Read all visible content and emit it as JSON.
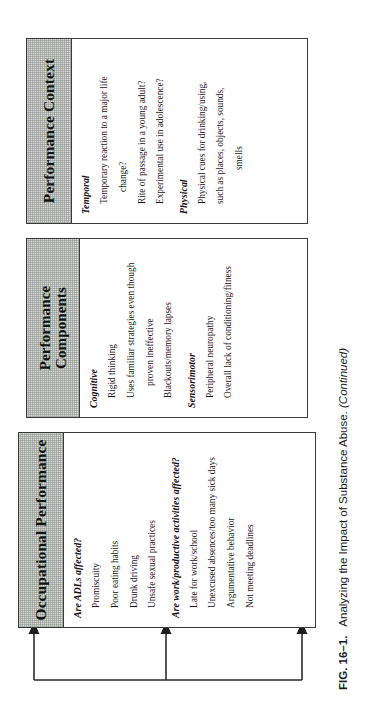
{
  "figure": {
    "caption_number": "FIG. 16–1.",
    "caption_text": "Analyzing the Impact of Substance Abuse.",
    "caption_continued": "(Continued)"
  },
  "boxes": [
    {
      "id": "occupational-performance",
      "header": "Occupational Performance",
      "groups": [
        {
          "label": "Are ADLs affected?",
          "items": [
            "Promiscuity",
            "Poor eating habits",
            "Drunk driving",
            "Unsafe sexual practices"
          ]
        },
        {
          "label": "Are work/productive activities affected?",
          "items": [
            "Late for work/school",
            "Unexcused absences/too many sick days",
            "Argumentative behavior",
            "Not meeting deadlines"
          ]
        }
      ]
    },
    {
      "id": "performance-components",
      "header_line1": "Performance",
      "header_line2": "Components",
      "groups": [
        {
          "label": "Cognitive",
          "items": [
            "Rigid thinking",
            "Uses familiar strategies even though",
            "proven ineffective",
            "Blackouts/memory lapses"
          ]
        },
        {
          "label": "Sensorimotor",
          "items": [
            "Peripheral neuropathy",
            "Overall lack of conditioning/fitness"
          ]
        }
      ]
    },
    {
      "id": "performance-context",
      "header": "Performance Context",
      "groups": [
        {
          "label": "Temporal",
          "items": [
            "Temporary reaction to a major life",
            "change?",
            "Rite of passage in a young adult?",
            "Experimental use in adolescence?"
          ]
        },
        {
          "label": "Physical",
          "items": [
            "Physical cues for drinking/using,",
            "such as places, objects, sounds,",
            "smells"
          ]
        }
      ]
    }
  ],
  "colors": {
    "header_fill": "#d9dbd9",
    "border": "#3a3a3a",
    "text": "#171717",
    "page": "#ffffff"
  }
}
